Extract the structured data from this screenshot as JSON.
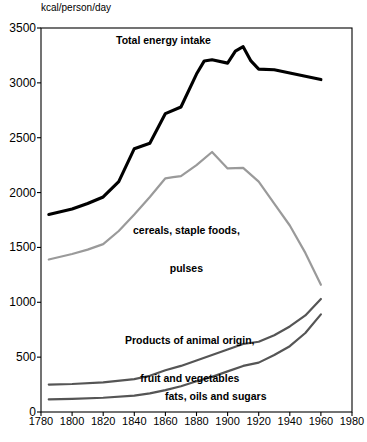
{
  "chart_data": {
    "type": "line",
    "title": "",
    "subtitle": "",
    "xlabel": "",
    "ylabel": "kcal/person/day",
    "y_unit_label": "kcal/person/day",
    "xlim": [
      1780,
      1980
    ],
    "ylim": [
      0,
      3500
    ],
    "grid": false,
    "legend_position": "inline-annotations",
    "x_ticks": [
      1780,
      1800,
      1820,
      1840,
      1860,
      1880,
      1900,
      1920,
      1940,
      1960,
      1980
    ],
    "y_ticks": [
      0,
      500,
      1000,
      1500,
      2000,
      2500,
      3000,
      3500
    ],
    "series": [
      {
        "name": "Total energy intake",
        "color": "#000000",
        "width": 3.1,
        "label_pos": {
          "x": 116,
          "y": 34
        },
        "x": [
          1785,
          1800,
          1810,
          1820,
          1830,
          1840,
          1850,
          1860,
          1870,
          1880,
          1885,
          1890,
          1900,
          1905,
          1910,
          1915,
          1920,
          1930,
          1940,
          1950,
          1960
        ],
        "values": [
          1800,
          1850,
          1900,
          1960,
          2100,
          2400,
          2450,
          2720,
          2780,
          3080,
          3200,
          3210,
          3180,
          3290,
          3330,
          3200,
          3125,
          3120,
          3090,
          3060,
          3030
        ]
      },
      {
        "name": "cereals, staple foods, pulses",
        "color": "#9a9a9a",
        "width": 2.2,
        "label_pos": {
          "x": 133,
          "y": 199
        },
        "x": [
          1785,
          1800,
          1810,
          1820,
          1830,
          1840,
          1850,
          1860,
          1865,
          1870,
          1880,
          1890,
          1900,
          1910,
          1920,
          1930,
          1940,
          1950,
          1960
        ],
        "values": [
          1390,
          1440,
          1480,
          1530,
          1650,
          1800,
          1960,
          2130,
          2140,
          2150,
          2250,
          2370,
          2220,
          2225,
          2100,
          1900,
          1700,
          1450,
          1160
        ]
      },
      {
        "name": "Products of animal origin, fruit and vegetables",
        "color": "#555555",
        "width": 2.2,
        "label_pos": {
          "x": 125,
          "y": 309
        },
        "x": [
          1785,
          1800,
          1820,
          1840,
          1850,
          1860,
          1870,
          1880,
          1890,
          1900,
          1910,
          1920,
          1930,
          1940,
          1950,
          1960
        ],
        "values": [
          250,
          255,
          270,
          300,
          330,
          380,
          420,
          470,
          520,
          570,
          620,
          640,
          700,
          780,
          880,
          1030
        ]
      },
      {
        "name": "fats, oils and sugars",
        "color": "#555555",
        "width": 2.2,
        "label_pos": {
          "x": 165,
          "y": 390
        },
        "x": [
          1785,
          1800,
          1820,
          1840,
          1850,
          1860,
          1870,
          1880,
          1890,
          1900,
          1910,
          1920,
          1930,
          1940,
          1950,
          1960
        ],
        "values": [
          115,
          120,
          130,
          150,
          170,
          200,
          235,
          280,
          320,
          370,
          420,
          450,
          520,
          600,
          720,
          890
        ]
      }
    ],
    "annotations": [
      {
        "text": "Total energy intake",
        "x": 116,
        "y": 34
      },
      {
        "text": "cereals, staple foods,",
        "x": 133,
        "y": 199
      },
      {
        "text": "pulses",
        "x": 168,
        "y": 212
      },
      {
        "text": "Products of animal origin,",
        "x": 125,
        "y": 309
      },
      {
        "text": "fruit and vegetables",
        "x": 146,
        "y": 322
      },
      {
        "text": "fats, oils and sugars",
        "x": 165,
        "y": 390
      }
    ]
  },
  "axes": {
    "unit_label": "kcal/person/day",
    "y_tick_labels": [
      "3500",
      "3000",
      "2500",
      "2000",
      "1500",
      "1000",
      "500",
      "0"
    ],
    "x_tick_labels": [
      "1780",
      "1800",
      "1820",
      "1840",
      "1860",
      "1880",
      "1900",
      "1920",
      "1940",
      "1960",
      "1980"
    ]
  },
  "labels": {
    "total": "Total energy intake",
    "cereals_line1": "cereals, staple foods,",
    "cereals_line2": "pulses",
    "animal_line1": "Products of animal origin,",
    "animal_line2": "fruit and vegetables",
    "fats": "fats, oils and sugars"
  }
}
